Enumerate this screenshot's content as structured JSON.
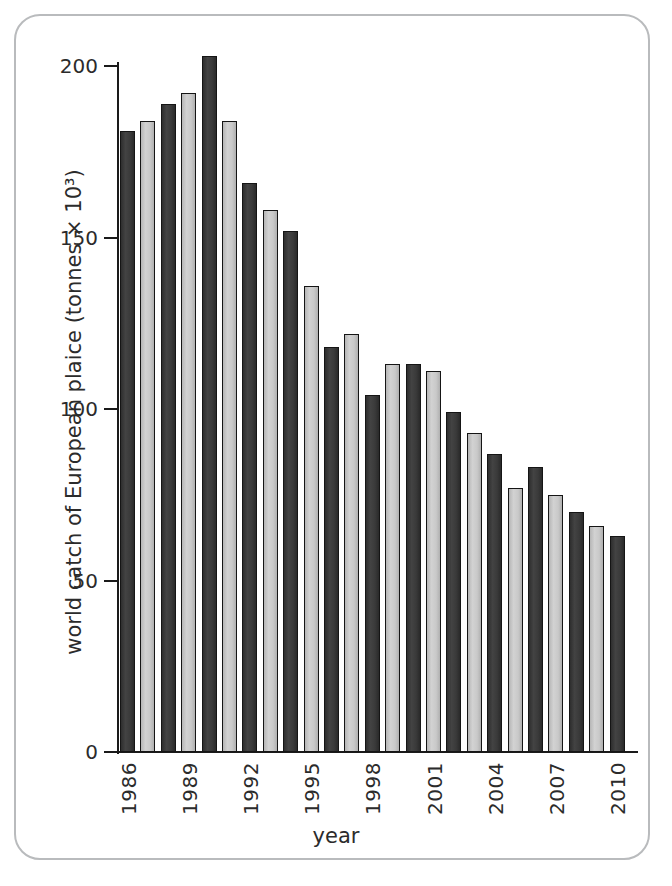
{
  "figure": {
    "frame_color": "#b9bbbd",
    "background": "#ffffff"
  },
  "chart_data": {
    "type": "bar",
    "title": "",
    "xlabel": "year",
    "ylabel": "world catch of European plaice (tonnes × 10³)",
    "ylim": [
      0,
      200
    ],
    "yticks": [
      0,
      50,
      100,
      150,
      200
    ],
    "ytick_labels": [
      "0",
      "50",
      "100",
      "150",
      "200"
    ],
    "grid": false,
    "legend": "none",
    "bar_colors": {
      "dark": "#3a3a3a",
      "light": "#c9c9c9",
      "outline": "#151515"
    },
    "categories": [
      "1986",
      "1987",
      "1988",
      "1989",
      "1990",
      "1991",
      "1992",
      "1993",
      "1994",
      "1995",
      "1996",
      "1997",
      "1998",
      "1999",
      "2000",
      "2001",
      "2002",
      "2003",
      "2004",
      "2005",
      "2006",
      "2007",
      "2008",
      "2009",
      "2010"
    ],
    "values": [
      181,
      184,
      189,
      192,
      203,
      184,
      166,
      158,
      152,
      136,
      118,
      122,
      104,
      113,
      113,
      111,
      99,
      93,
      87,
      77,
      83,
      75,
      70,
      66,
      63
    ],
    "shades": [
      "dark",
      "light",
      "dark",
      "light",
      "dark",
      "light",
      "dark",
      "light",
      "dark",
      "light",
      "dark",
      "light",
      "dark",
      "light",
      "dark",
      "light",
      "dark",
      "light",
      "dark",
      "light",
      "dark",
      "light",
      "dark",
      "light",
      "dark"
    ],
    "xtick_labels": [
      "1986",
      "1989",
      "1992",
      "1995",
      "1998",
      "2001",
      "2004",
      "2007",
      "2010"
    ],
    "xtick_categories": [
      "1986",
      "1989",
      "1992",
      "1995",
      "1998",
      "2001",
      "2004",
      "2007",
      "2010"
    ]
  }
}
